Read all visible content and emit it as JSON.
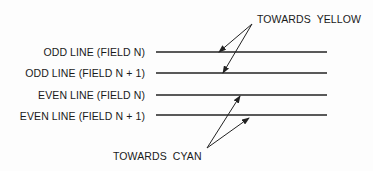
{
  "diagram": {
    "rows": [
      {
        "label": "ODD LINE (FIELD N)",
        "y": 52
      },
      {
        "label": "ODD LINE (FIELD N + 1)",
        "y": 73
      },
      {
        "label": "EVEN LINE (FIELD N)",
        "y": 95
      },
      {
        "label": "EVEN LINE (FIELD N + 1)",
        "y": 115
      }
    ],
    "line_x_start": 156,
    "line_x_end": 327,
    "annotations": {
      "yellow": {
        "text": "TOWARDS  YELLOW",
        "origin": [
          252,
          24
        ],
        "targets": [
          [
            219,
            52
          ],
          [
            223,
            73
          ]
        ]
      },
      "cyan": {
        "text": "TOWARDS  CYAN",
        "origin": [
          207,
          148
        ],
        "targets": [
          [
            240,
            96
          ],
          [
            249,
            118
          ]
        ]
      }
    },
    "line_color": "#222222"
  }
}
